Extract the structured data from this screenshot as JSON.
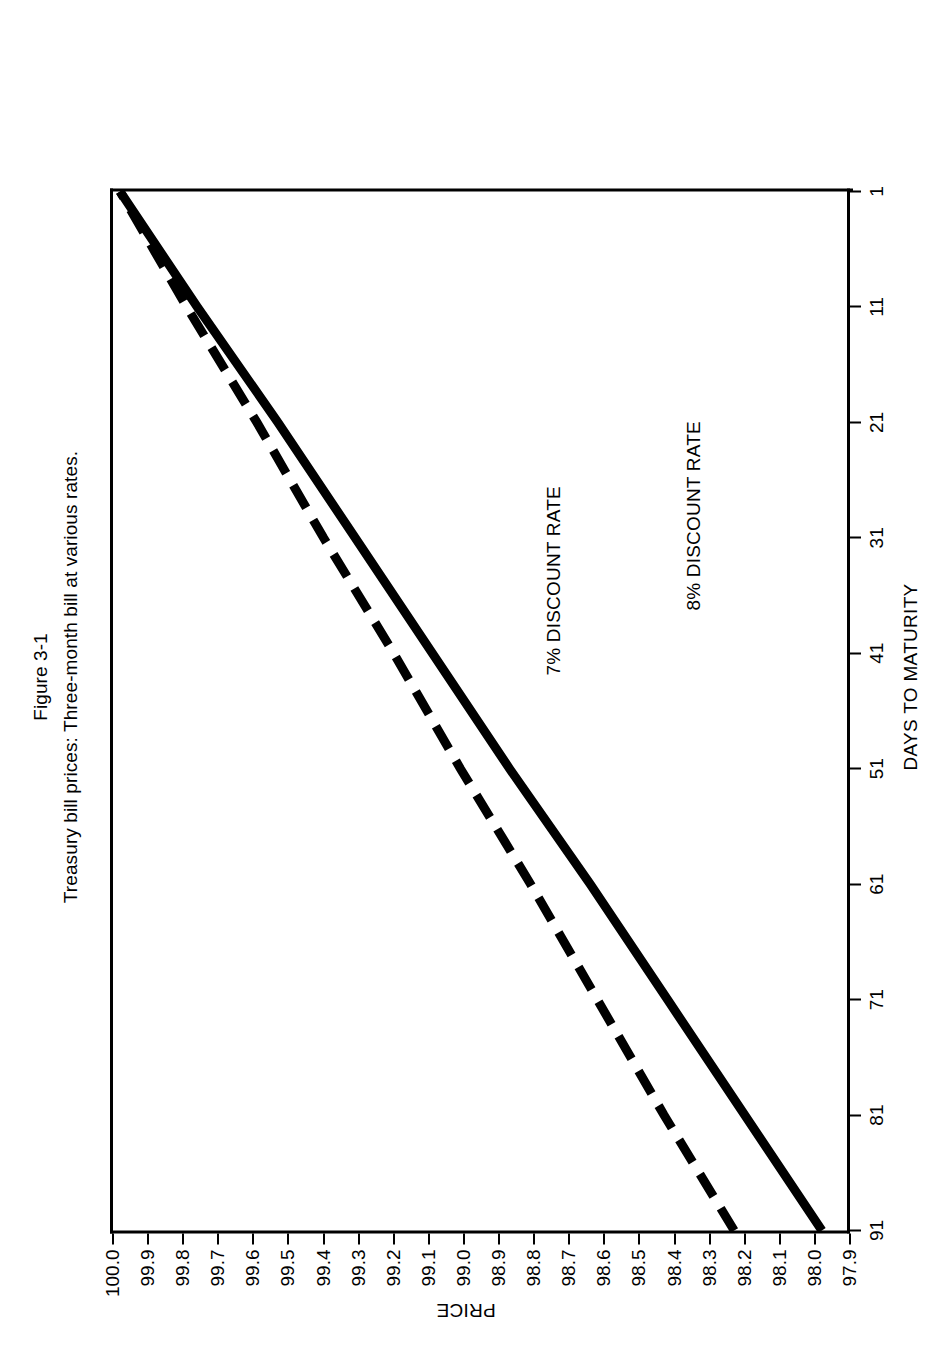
{
  "figure": {
    "number": "Figure 3-1",
    "caption": "Treasury bill prices: Three-month bill at various rates."
  },
  "axes": {
    "x_title": "DAYS TO MATURITY",
    "y_title": "PRICE"
  },
  "annotations": {
    "series_7_label": "7% DISCOUNT RATE",
    "series_8_label": "8% DISCOUNT RATE"
  },
  "chart_data": {
    "type": "line",
    "title": "Treasury bill prices: Three-month bill at various rates.",
    "subtitle": "Figure 3-1",
    "xlabel": "DAYS TO MATURITY",
    "ylabel": "PRICE",
    "xlim": [
      91,
      1
    ],
    "ylim": [
      97.9,
      100.0
    ],
    "x_ticks": [
      91,
      81,
      71,
      61,
      51,
      41,
      31,
      21,
      11,
      1
    ],
    "x_tick_labels": [
      "91",
      "81",
      "71",
      "61",
      "51",
      "41",
      "31",
      "21",
      "11",
      "1"
    ],
    "y_ticks": [
      100.0,
      99.9,
      99.8,
      99.7,
      99.6,
      99.5,
      99.4,
      99.3,
      99.2,
      99.1,
      99.0,
      98.9,
      98.8,
      98.7,
      98.6,
      98.5,
      98.4,
      98.3,
      98.2,
      98.1,
      98.0,
      97.9
    ],
    "y_tick_labels": [
      "100.0",
      "99.9",
      "99.8",
      "99.7",
      "99.6",
      "99.5",
      "99.4",
      "99.3",
      "99.2",
      "99.1",
      "99.0",
      "98.9",
      "98.8",
      "98.7",
      "98.6",
      "98.5",
      "98.4",
      "98.3",
      "98.2",
      "98.1",
      "98.0",
      "97.9"
    ],
    "grid": false,
    "legend_position": "in-plot annotations",
    "x_axis_direction": "decreasing left-to-right (91 days at left, 1 day at right)",
    "series": [
      {
        "name": "7% DISCOUNT RATE",
        "style": "dashed",
        "color": "#000000",
        "x": [
          91,
          81,
          71,
          61,
          51,
          41,
          31,
          21,
          11,
          1
        ],
        "values": [
          98.23,
          98.43,
          98.62,
          98.81,
          99.01,
          99.2,
          99.4,
          99.59,
          99.79,
          99.98
        ]
      },
      {
        "name": "8% DISCOUNT RATE",
        "style": "solid",
        "color": "#000000",
        "x": [
          91,
          81,
          71,
          61,
          51,
          41,
          31,
          21,
          11,
          1
        ],
        "values": [
          97.98,
          98.2,
          98.42,
          98.64,
          98.87,
          99.09,
          99.31,
          99.53,
          99.76,
          99.98
        ]
      }
    ]
  }
}
